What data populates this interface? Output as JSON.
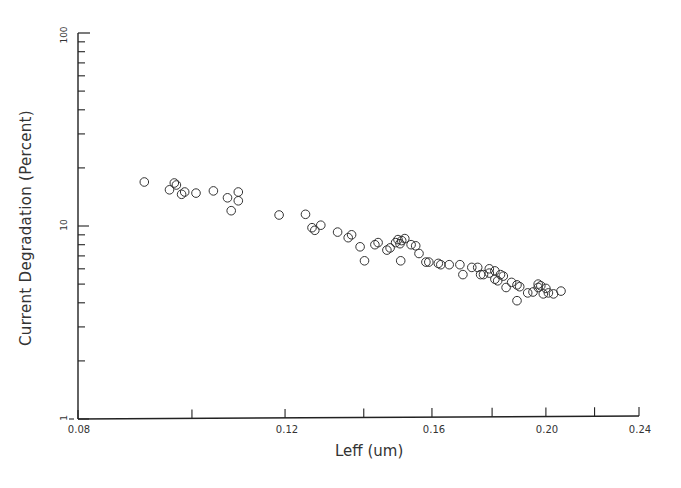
{
  "chart_data": {
    "type": "scatter",
    "title": "",
    "xlabel": "Leff (um)",
    "ylabel": "Current Degradation (Percent)",
    "xscale": "log",
    "yscale": "log",
    "xlim": [
      0.08,
      0.24
    ],
    "ylim": [
      1,
      100
    ],
    "x_tick_labels": [
      "0.08",
      "0.12",
      "0.16",
      "0.20",
      "0.24"
    ],
    "x_tick_values": [
      0.08,
      0.1,
      0.12,
      0.14,
      0.16,
      0.18,
      0.2,
      0.22,
      0.24
    ],
    "y_tick_labels": [
      "100",
      "10",
      "1"
    ],
    "grid": false,
    "legend": null,
    "marker": "open-circle",
    "series": [
      {
        "name": "data",
        "points": [
          [
            0.0911,
            16.9
          ],
          [
            0.0957,
            15.4
          ],
          [
            0.0966,
            16.7
          ],
          [
            0.097,
            16.3
          ],
          [
            0.098,
            14.6
          ],
          [
            0.0986,
            15.0
          ],
          [
            0.1008,
            14.8
          ],
          [
            0.1043,
            15.2
          ],
          [
            0.1072,
            14.0
          ],
          [
            0.108,
            12.0
          ],
          [
            0.1095,
            13.5
          ],
          [
            0.1095,
            15.0
          ],
          [
            0.1186,
            11.4
          ],
          [
            0.1249,
            11.5
          ],
          [
            0.1265,
            9.8
          ],
          [
            0.1272,
            9.5
          ],
          [
            0.1287,
            10.1
          ],
          [
            0.133,
            9.3
          ],
          [
            0.1358,
            8.7
          ],
          [
            0.1367,
            9.0
          ],
          [
            0.139,
            7.8
          ],
          [
            0.1402,
            6.6
          ],
          [
            0.1431,
            8.0
          ],
          [
            0.144,
            8.2
          ],
          [
            0.1465,
            7.5
          ],
          [
            0.1474,
            7.7
          ],
          [
            0.149,
            8.2
          ],
          [
            0.1497,
            8.5
          ],
          [
            0.1503,
            8.1
          ],
          [
            0.1508,
            8.4
          ],
          [
            0.1517,
            8.6
          ],
          [
            0.1505,
            6.6
          ],
          [
            0.1536,
            8.0
          ],
          [
            0.155,
            7.9
          ],
          [
            0.156,
            7.2
          ],
          [
            0.1581,
            6.5
          ],
          [
            0.159,
            6.5
          ],
          [
            0.162,
            6.4
          ],
          [
            0.1628,
            6.3
          ],
          [
            0.1655,
            6.3
          ],
          [
            0.169,
            6.3
          ],
          [
            0.17,
            5.6
          ],
          [
            0.173,
            6.1
          ],
          [
            0.175,
            6.1
          ],
          [
            0.176,
            5.6
          ],
          [
            0.177,
            5.6
          ],
          [
            0.179,
            6.0
          ],
          [
            0.179,
            5.7
          ],
          [
            0.181,
            5.3
          ],
          [
            0.181,
            5.85
          ],
          [
            0.182,
            5.2
          ],
          [
            0.183,
            5.6
          ],
          [
            0.184,
            5.5
          ],
          [
            0.185,
            4.8
          ],
          [
            0.187,
            5.1
          ],
          [
            0.189,
            4.95
          ],
          [
            0.19,
            4.85
          ],
          [
            0.189,
            4.1
          ],
          [
            0.193,
            4.5
          ],
          [
            0.195,
            4.55
          ],
          [
            0.197,
            4.8
          ],
          [
            0.197,
            5.0
          ],
          [
            0.198,
            4.9
          ],
          [
            0.199,
            4.45
          ],
          [
            0.2,
            4.75
          ],
          [
            0.201,
            4.5
          ],
          [
            0.203,
            4.45
          ],
          [
            0.206,
            4.6
          ]
        ]
      }
    ]
  },
  "axes": {
    "x_label": "Leff (um)",
    "y_label": "Current Degradation (Percent)",
    "x_ticks": [
      {
        "label": "0.08",
        "value": 0.08
      },
      {
        "label": "0.12",
        "value": 0.12
      },
      {
        "label": "0.16",
        "value": 0.16
      },
      {
        "label": "0.20",
        "value": 0.2
      },
      {
        "label": "0.24",
        "value": 0.24
      }
    ],
    "y_ticks": [
      {
        "label": "100",
        "value": 100
      },
      {
        "label": "10",
        "value": 10
      },
      {
        "label": "1",
        "value": 1
      }
    ]
  },
  "style": {
    "axis_color": "#222222",
    "marker_color": "#333333",
    "background": "#ffffff"
  }
}
